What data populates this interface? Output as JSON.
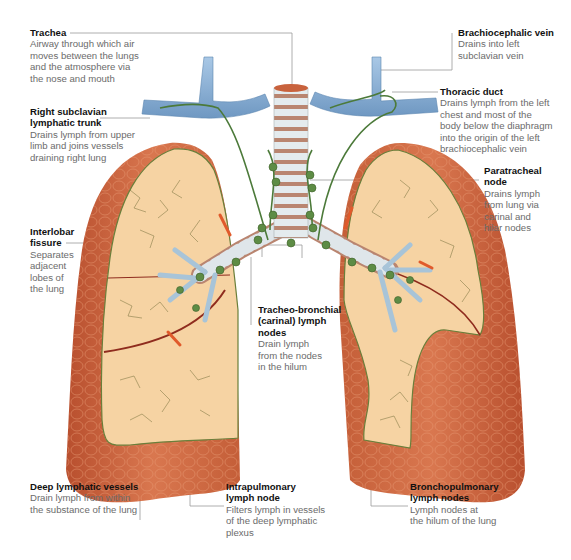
{
  "figure": {
    "colors": {
      "lung_surface": "#c8623d",
      "lung_cut_surface": "#f6d3a3",
      "trachea_cartilage": "#dfe6ea",
      "trachea_ring": "#b98570",
      "vein": "#8fb4d6",
      "lymph_vessel": "#4c7a3a",
      "lymph_node": "#5d8c45",
      "artery": "#e05a2b",
      "leader_line": "#9a9a9a"
    }
  },
  "labels": {
    "trachea": {
      "title": "Trachea",
      "desc": [
        "Airway through which air",
        "moves between the lungs",
        "and the atmosphere via",
        "the nose and mouth"
      ]
    },
    "right_subclavian": {
      "title": [
        "Right subclavian",
        "lymphatic trunk"
      ],
      "desc": [
        "Drains lymph from upper",
        "limb and joins vessels",
        "draining right lung"
      ]
    },
    "interlobar": {
      "title": [
        "Interlobar",
        "fissure"
      ],
      "desc": [
        "Separates",
        "adjacent",
        "lobes of",
        "the lung"
      ]
    },
    "brachiocephalic": {
      "title": "Brachiocephalic vein",
      "desc": [
        "Drains into left",
        "subclavian vein"
      ]
    },
    "thoracic_duct": {
      "title": "Thoracic duct",
      "desc": [
        "Drains lymph from the left",
        "chest and most of the",
        "body below the diaphragm",
        "into the origin of the left",
        "brachiocephalic vein"
      ]
    },
    "paratracheal": {
      "title": [
        "Paratracheal",
        "node"
      ],
      "desc": [
        "Drains lymph",
        "from lung via",
        "carinal and",
        "hilar nodes"
      ]
    },
    "tracheobronchial": {
      "title": [
        "Tracheo-bronchial",
        "(carinal) lymph",
        "nodes"
      ],
      "desc": [
        "Drain lymph",
        "from the nodes",
        "in the hilum"
      ]
    },
    "deep_lymphatic": {
      "title": "Deep lymphatic vessels",
      "desc": [
        "Drain lymph from within",
        "the substance of the lung"
      ]
    },
    "intrapulmonary": {
      "title": [
        "Intrapulmonary",
        "lymph node"
      ],
      "desc": [
        "Filters lymph in vessels",
        "of the deep lymphatic",
        "plexus"
      ]
    },
    "bronchopulmonary": {
      "title": [
        "Bronchopulmonary",
        "lymph nodes"
      ],
      "desc": [
        "Lymph nodes at",
        "the hilum of the lung"
      ]
    }
  }
}
